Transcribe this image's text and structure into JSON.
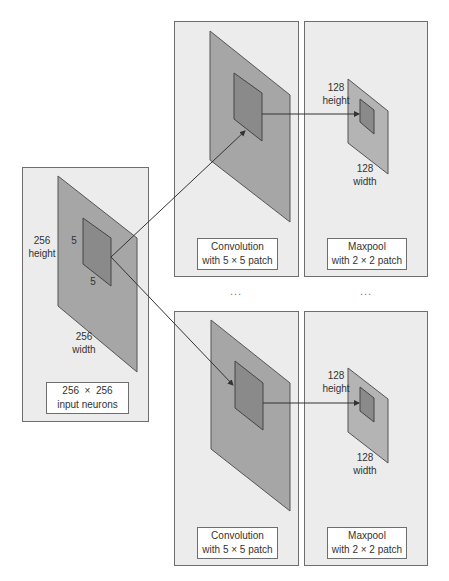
{
  "diagram": {
    "colors": {
      "panel_bg": "#ececec",
      "panel_border": "#6e6e6e",
      "plane_fill": "#a6a6a6",
      "patch_fill": "#8a8a8a",
      "line": "#333333"
    },
    "input": {
      "height_value": "256",
      "height_label": "height",
      "width_value": "256",
      "width_label": "width",
      "patch_height": "5",
      "patch_width": "5",
      "box_line1": "256  ×  256",
      "box_line2": "input neurons"
    },
    "rows": [
      {
        "conv": {
          "box_line1": "Convolution",
          "box_line2": "with 5 × 5 patch"
        },
        "pool": {
          "height_value": "128",
          "height_label": "height",
          "width_value": "128",
          "width_label": "width",
          "box_line1": "Maxpool",
          "box_line2": "with 2 × 2 patch"
        }
      },
      {
        "conv": {
          "box_line1": "Convolution",
          "box_line2": "with 5 × 5 patch"
        },
        "pool": {
          "height_value": "128",
          "height_label": "height",
          "width_value": "128",
          "width_label": "width",
          "box_line1": "Maxpool",
          "box_line2": "with 2 × 2 patch"
        }
      }
    ],
    "ellipsis": [
      "...",
      "..."
    ]
  }
}
